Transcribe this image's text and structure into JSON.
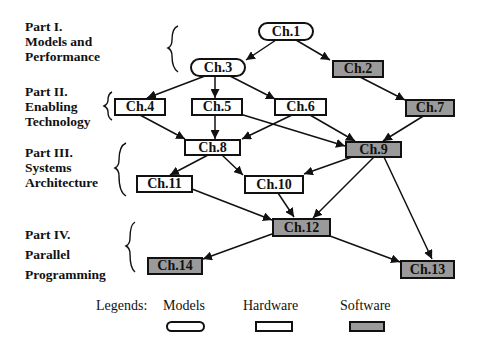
{
  "parts": [
    {
      "id": "part1",
      "lines": [
        "Part I.",
        "Models and",
        "Performance"
      ]
    },
    {
      "id": "part2",
      "lines": [
        "Part II.",
        "Enabling",
        "Technology"
      ]
    },
    {
      "id": "part3",
      "lines": [
        "Part III.",
        "Systems",
        "Architecture"
      ]
    },
    {
      "id": "part4",
      "lines": [
        "Part IV.",
        "Parallel",
        "Programming"
      ]
    }
  ],
  "nodes": {
    "ch1": {
      "label": "Ch.1",
      "type": "Models"
    },
    "ch2": {
      "label": "Ch.2",
      "type": "Software"
    },
    "ch3": {
      "label": "Ch.3",
      "type": "Models"
    },
    "ch4": {
      "label": "Ch.4",
      "type": "Hardware"
    },
    "ch5": {
      "label": "Ch.5",
      "type": "Hardware"
    },
    "ch6": {
      "label": "Ch.6",
      "type": "Hardware"
    },
    "ch7": {
      "label": "Ch.7",
      "type": "Software"
    },
    "ch8": {
      "label": "Ch.8",
      "type": "Hardware"
    },
    "ch9": {
      "label": "Ch.9",
      "type": "Software"
    },
    "ch10": {
      "label": "Ch.10",
      "type": "Hardware"
    },
    "ch11": {
      "label": "Ch.11",
      "type": "Hardware"
    },
    "ch12": {
      "label": "Ch.12",
      "type": "Software"
    },
    "ch13": {
      "label": "Ch.13",
      "type": "Software"
    },
    "ch14": {
      "label": "Ch.14",
      "type": "Software"
    }
  },
  "edges": [
    [
      "Ch.1",
      "Ch.3"
    ],
    [
      "Ch.1",
      "Ch.2"
    ],
    [
      "Ch.2",
      "Ch.7"
    ],
    [
      "Ch.3",
      "Ch.4"
    ],
    [
      "Ch.3",
      "Ch.5"
    ],
    [
      "Ch.3",
      "Ch.6"
    ],
    [
      "Ch.4",
      "Ch.8"
    ],
    [
      "Ch.5",
      "Ch.8"
    ],
    [
      "Ch.6",
      "Ch.8"
    ],
    [
      "Ch.5",
      "Ch.9"
    ],
    [
      "Ch.6",
      "Ch.9"
    ],
    [
      "Ch.7",
      "Ch.9"
    ],
    [
      "Ch.8",
      "Ch.11"
    ],
    [
      "Ch.8",
      "Ch.10"
    ],
    [
      "Ch.9",
      "Ch.10"
    ],
    [
      "Ch.9",
      "Ch.12"
    ],
    [
      "Ch.9",
      "Ch.13"
    ],
    [
      "Ch.10",
      "Ch.12"
    ],
    [
      "Ch.11",
      "Ch.12"
    ],
    [
      "Ch.12",
      "Ch.14"
    ],
    [
      "Ch.12",
      "Ch.13"
    ]
  ],
  "legend": {
    "title": "Legends:",
    "items": [
      {
        "label": "Models",
        "shape": "rounded"
      },
      {
        "label": "Hardware",
        "shape": "white-rect"
      },
      {
        "label": "Software",
        "shape": "gray-rect"
      }
    ]
  },
  "colors": {
    "software_fill": "#9a9a9a",
    "stroke": "#111111"
  }
}
